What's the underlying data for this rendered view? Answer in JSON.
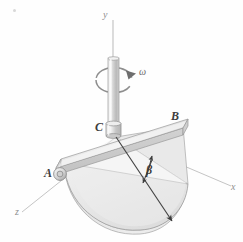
{
  "figure": {
    "background_color": "#fefefe",
    "labels": {
      "y_axis": "y",
      "x_axis": "x",
      "z_axis": "z",
      "omega": "ω",
      "beta": "β",
      "point_a": "A",
      "point_b": "B",
      "point_c": "C"
    },
    "colors": {
      "plate_fill": "#e8e8e8",
      "plate_edge": "#9a9a9a",
      "bar_fill": "#dcdcdc",
      "bar_edge": "#9c9c9c",
      "shaft_fill": "#cfcfcf",
      "shaft_edge": "#8d8d8d",
      "axis_line": "#b5b5b5",
      "radial_line": "#4a4a4a",
      "label_text": "#3d3d3d",
      "axis_label_text": "#8e8e8e"
    },
    "geometry": {
      "shaft_axis": "vertical y-axis through C",
      "rotation_sense": "counterclockwise about y",
      "plate_shape": "semicircular",
      "bar_name": "AB",
      "hub_point": "C"
    }
  }
}
